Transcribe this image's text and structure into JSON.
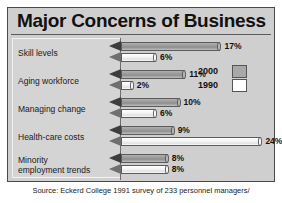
{
  "chart_data": {
    "type": "bar",
    "title": "Major Concerns of Business",
    "orientation": "horizontal",
    "xlabel": "",
    "ylabel": "",
    "grid": false,
    "legend_position": "right-inside-top",
    "xlim": [
      0,
      24
    ],
    "categories": [
      "Skill levels",
      "Aging workforce",
      "Managing change",
      "Health-care costs",
      "Minority employment trends"
    ],
    "series": [
      {
        "name": "2000",
        "color": "#a8a8a8",
        "values": [
          17,
          11,
          10,
          9,
          8
        ],
        "labels": [
          "17%",
          "11%",
          "10%",
          "9%",
          "8%"
        ]
      },
      {
        "name": "1990",
        "color": "#ffffff",
        "values": [
          6,
          2,
          6,
          24,
          8
        ],
        "labels": [
          "6%",
          "2%",
          "6%",
          "8%",
          "8%"
        ]
      }
    ],
    "series_1990_values": [
      6,
      2,
      6,
      24,
      8
    ],
    "source": "Source: Eckerd College 1991 survey of 233 personnel managers/"
  },
  "panel": {
    "title": "Major Concerns of Business",
    "source": "Source: Eckerd College 1991 survey of 233 personnel managers/"
  },
  "rows": [
    {
      "label_line1": "Skill levels",
      "label_line2": "",
      "bar2000": {
        "value": 17,
        "label": "17%"
      },
      "bar1990": {
        "value": 6,
        "label": "6%"
      }
    },
    {
      "label_line1": "Aging workforce",
      "label_line2": "",
      "bar2000": {
        "value": 11,
        "label": "11%"
      },
      "bar1990": {
        "value": 2,
        "label": "2%"
      }
    },
    {
      "label_line1": "Managing change",
      "label_line2": "",
      "bar2000": {
        "value": 10,
        "label": "10%"
      },
      "bar1990": {
        "value": 6,
        "label": "6%"
      }
    },
    {
      "label_line1": "Health-care costs",
      "label_line2": "",
      "bar2000": {
        "value": 9,
        "label": "9%"
      },
      "bar1990": {
        "value": 24,
        "label": "24%"
      }
    },
    {
      "label_line1": "Minority",
      "label_line2": "employment trends",
      "bar2000": {
        "value": 8,
        "label": "8%"
      },
      "bar1990": {
        "value": 8,
        "label": "8%"
      }
    }
  ],
  "legend": {
    "items": [
      {
        "label": "2000",
        "color": "#a8a8a8"
      },
      {
        "label": "1990",
        "color": "#ffffff"
      }
    ]
  }
}
